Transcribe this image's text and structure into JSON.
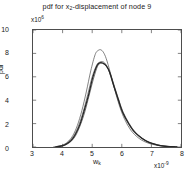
{
  "chart_data": {
    "type": "line",
    "title": "pdf for x2-displacement of node 9",
    "title_main_a": "pdf for x",
    "title_sub": "2",
    "title_main_b": "-displacement of node 9",
    "xlabel": "w",
    "xlabel_sub": "k",
    "ylabel": "pdf",
    "x_exponent_prefix": "x10",
    "x_exponent_value": "-9",
    "y_exponent_prefix": "x10",
    "y_exponent_value": "6",
    "xlim": [
      3,
      8
    ],
    "ylim": [
      0,
      10
    ],
    "xticks": [
      3,
      4,
      5,
      6,
      7,
      8
    ],
    "yticks": [
      0,
      2,
      4,
      6,
      8,
      10
    ],
    "xtick_labels": [
      "3",
      "4",
      "5",
      "6",
      "7",
      "8"
    ],
    "ytick_labels": [
      "0",
      "2",
      "4",
      "6",
      "8",
      "10"
    ],
    "grid": false,
    "legend": "none",
    "x_units": "1e-9",
    "y_units": "1e6",
    "series": [
      {
        "name": "reference",
        "style": "thin",
        "color": "#4d4d4d",
        "peak_x": 5.3,
        "peak_y": 8.3,
        "x": [
          3.7,
          3.9,
          4.05,
          4.2,
          4.35,
          4.5,
          4.65,
          4.8,
          4.95,
          5.1,
          5.2,
          5.3,
          5.4,
          5.5,
          5.65,
          5.8,
          5.95,
          6.1,
          6.3,
          6.55,
          6.8,
          7.05,
          7.3,
          7.55,
          7.8
        ],
        "values": [
          0.02,
          0.08,
          0.22,
          0.5,
          1.0,
          1.85,
          3.1,
          4.7,
          6.5,
          7.9,
          8.25,
          8.3,
          8.0,
          7.35,
          6.0,
          4.55,
          3.3,
          2.35,
          1.45,
          0.8,
          0.42,
          0.22,
          0.1,
          0.04,
          0.01
        ]
      },
      {
        "name": "estimate-1",
        "style": "thin",
        "color": "#555555",
        "peak_x": 5.32,
        "peak_y": 7.3,
        "x": [
          3.75,
          3.95,
          4.1,
          4.25,
          4.4,
          4.55,
          4.7,
          4.85,
          5.0,
          5.15,
          5.25,
          5.35,
          5.45,
          5.55,
          5.7,
          5.85,
          6.0,
          6.2,
          6.4,
          6.65,
          6.9,
          7.15,
          7.4,
          7.65,
          7.85
        ],
        "values": [
          0.03,
          0.1,
          0.25,
          0.55,
          1.05,
          1.9,
          3.05,
          4.5,
          6.0,
          7.0,
          7.25,
          7.3,
          7.1,
          6.6,
          5.45,
          4.2,
          3.1,
          2.1,
          1.35,
          0.76,
          0.4,
          0.2,
          0.09,
          0.03,
          0.01
        ]
      },
      {
        "name": "estimate-2",
        "style": "thin",
        "color": "#3c3c3c",
        "peak_x": 5.28,
        "peak_y": 7.15,
        "x": [
          3.8,
          4.0,
          4.15,
          4.3,
          4.45,
          4.6,
          4.75,
          4.9,
          5.05,
          5.18,
          5.28,
          5.38,
          5.48,
          5.6,
          5.75,
          5.9,
          6.05,
          6.25,
          6.45,
          6.7,
          6.95,
          7.2,
          7.45,
          7.7,
          7.88
        ],
        "values": [
          0.02,
          0.09,
          0.24,
          0.52,
          1.02,
          1.88,
          3.0,
          4.45,
          5.9,
          6.9,
          7.15,
          7.1,
          6.9,
          6.35,
          5.2,
          4.0,
          2.95,
          2.0,
          1.28,
          0.72,
          0.38,
          0.19,
          0.08,
          0.03,
          0.01
        ]
      },
      {
        "name": "estimate-3",
        "style": "thick",
        "color": "#262626",
        "peak_x": 5.3,
        "peak_y": 7.2,
        "x": [
          3.78,
          3.98,
          4.12,
          4.28,
          4.42,
          4.58,
          4.72,
          4.88,
          5.02,
          5.16,
          5.26,
          5.36,
          5.46,
          5.58,
          5.72,
          5.88,
          6.02,
          6.22,
          6.42,
          6.68,
          6.92,
          7.18,
          7.42,
          7.68,
          7.86
        ],
        "values": [
          0.02,
          0.09,
          0.24,
          0.53,
          1.03,
          1.89,
          3.03,
          4.48,
          5.95,
          6.95,
          7.2,
          7.18,
          6.98,
          6.45,
          5.3,
          4.08,
          3.02,
          2.05,
          1.31,
          0.74,
          0.39,
          0.19,
          0.08,
          0.03,
          0.01
        ]
      }
    ]
  },
  "axis_color": "#4d4d4d"
}
